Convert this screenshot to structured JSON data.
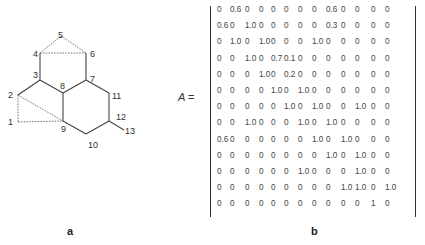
{
  "panel_a": {
    "label": "a",
    "nodes": [
      {
        "id": "1",
        "x": 12,
        "y": 120
      },
      {
        "id": "2",
        "x": 12,
        "y": 94
      },
      {
        "id": "3",
        "x": 36,
        "y": 80
      },
      {
        "id": "4",
        "x": 36,
        "y": 53
      },
      {
        "id": "5",
        "x": 60,
        "y": 36
      },
      {
        "id": "6",
        "x": 88,
        "y": 53
      },
      {
        "id": "7",
        "x": 92,
        "y": 80
      },
      {
        "id": "8",
        "x": 62,
        "y": 87
      },
      {
        "id": "9",
        "x": 62,
        "y": 128
      },
      {
        "id": "10",
        "x": 88,
        "y": 145
      },
      {
        "id": "11",
        "x": 112,
        "y": 97
      },
      {
        "id": "12",
        "x": 115,
        "y": 117
      },
      {
        "id": "13",
        "x": 125,
        "y": 132
      }
    ],
    "solid_edges": [
      [
        "2",
        "3"
      ],
      [
        "3",
        "4"
      ],
      [
        "3",
        "8"
      ],
      [
        "8",
        "7"
      ],
      [
        "8",
        "9"
      ],
      [
        "7",
        "6"
      ],
      [
        "7",
        "11"
      ],
      [
        "11",
        "12"
      ],
      [
        "12",
        "13"
      ],
      [
        "12",
        "10"
      ],
      [
        "10",
        "9"
      ]
    ],
    "dashed_edges": [
      [
        "4",
        "5"
      ],
      [
        "5",
        "6"
      ],
      [
        "4",
        "6"
      ],
      [
        "2",
        "1"
      ],
      [
        "1",
        "9"
      ],
      [
        "2",
        "9"
      ]
    ]
  },
  "panel_b": {
    "label": "b",
    "equation_symbol": "A",
    "equation_sign": "=",
    "matrix": [
      [
        "0",
        "0.6",
        "0",
        "0",
        "0",
        "0",
        "0",
        "0",
        "0.6",
        "0",
        "0",
        "0",
        "0"
      ],
      [
        "0.6",
        "0",
        "1.0",
        "0",
        "0",
        "0",
        "0",
        "0",
        "0.3",
        "0",
        "0",
        "0",
        "0"
      ],
      [
        "0",
        "1.0",
        "0",
        "1.0",
        "0",
        "0",
        "0",
        "1.0",
        "0",
        "0",
        "0",
        "0",
        "0"
      ],
      [
        "0",
        "0",
        "1.0",
        "0",
        "0.7",
        "0.1",
        "0",
        "0",
        "0",
        "0",
        "0",
        "0",
        "0"
      ],
      [
        "0",
        "0",
        "0",
        "1.0",
        "0",
        "0.2",
        "0",
        "0",
        "0",
        "0",
        "0",
        "0",
        "0"
      ],
      [
        "0",
        "0",
        "0",
        "0",
        "1.0",
        "0",
        "1.0",
        "0",
        "0",
        "0",
        "0",
        "0",
        "0"
      ],
      [
        "0",
        "0",
        "0",
        "0",
        "0",
        "1.0",
        "0",
        "1.0",
        "0",
        "0",
        "1.0",
        "0",
        "0"
      ],
      [
        "0",
        "0",
        "1.0",
        "0",
        "0",
        "0",
        "1.0",
        "0",
        "1.0",
        "0",
        "0",
        "0",
        "0"
      ],
      [
        "0.6",
        "0",
        "0",
        "0",
        "0",
        "0",
        "0",
        "1.0",
        "0",
        "1.0",
        "0",
        "0",
        "0"
      ],
      [
        "0",
        "0",
        "0",
        "0",
        "0",
        "0",
        "0",
        "0",
        "1.0",
        "0",
        "1.0",
        "0",
        "0"
      ],
      [
        "0",
        "0",
        "0",
        "0",
        "0",
        "0",
        "1.0",
        "0",
        "0",
        "0",
        "1.0",
        "0",
        "0"
      ],
      [
        "0",
        "0",
        "0",
        "0",
        "0",
        "0",
        "0",
        "0",
        "0",
        "1.0",
        "1.0",
        "0",
        "1.0"
      ],
      [
        "0",
        "0",
        "0",
        "0",
        "0",
        "0",
        "0",
        "0",
        "0",
        "0",
        "0",
        "1",
        "0"
      ]
    ]
  }
}
